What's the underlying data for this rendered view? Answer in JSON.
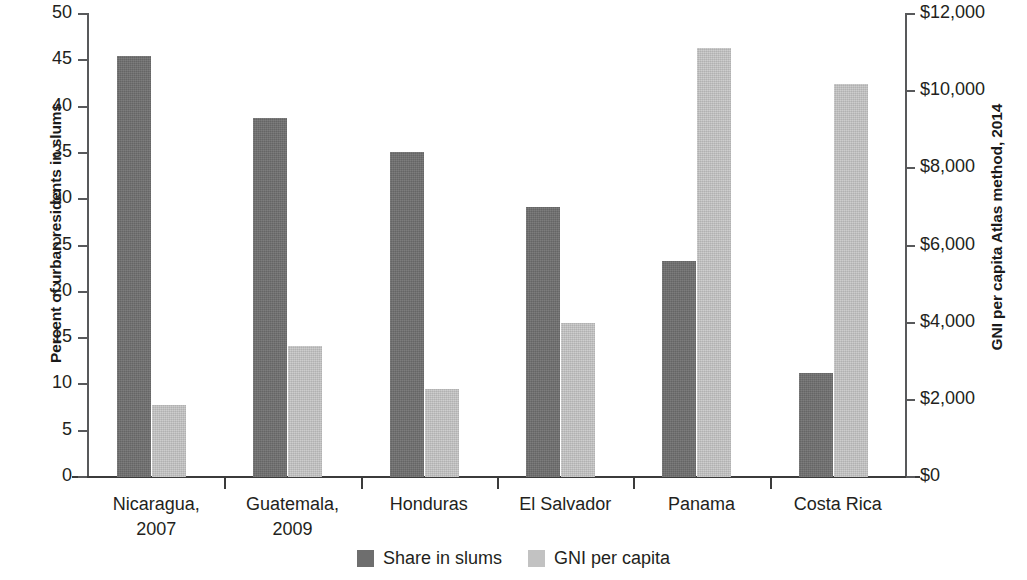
{
  "chart_data": {
    "type": "bar",
    "title": "",
    "categories": [
      "Nicaragua, 2007",
      "Guatemala, 2009",
      "Honduras",
      "El Salvador",
      "Panama",
      "Costa Rica"
    ],
    "category_lines": [
      [
        "Nicaragua,",
        "2007"
      ],
      [
        "Guatemala,",
        "2009"
      ],
      [
        "Honduras"
      ],
      [
        "El Salvador"
      ],
      [
        "Panama"
      ],
      [
        "Costa Rica"
      ]
    ],
    "series": [
      {
        "name": "Share in slums",
        "axis": "left",
        "unit": "percent",
        "color": "#6e6e6e",
        "values": [
          45.5,
          38.8,
          35.1,
          29.2,
          23.3,
          11.2
        ]
      },
      {
        "name": "GNI per capita",
        "axis": "right",
        "unit": "USD",
        "color": "#c2c2c2",
        "values": [
          1870,
          3400,
          2270,
          3980,
          11130,
          10190
        ]
      }
    ],
    "xlabel": "",
    "ylabel": "Percent of urban residents in slums",
    "y2label": "GNI per capita Atlas method, 2014",
    "ylim": [
      0,
      50
    ],
    "y2lim": [
      0,
      12000
    ],
    "yticks": [
      0,
      5,
      10,
      15,
      20,
      25,
      30,
      35,
      40,
      45,
      50
    ],
    "ytick_labels": [
      "0",
      "5",
      "10",
      "15",
      "20",
      "25",
      "30",
      "35",
      "40",
      "45",
      "50"
    ],
    "y2ticks": [
      0,
      2000,
      4000,
      6000,
      8000,
      10000,
      12000
    ],
    "y2tick_labels": [
      "$0",
      "$2,000",
      "$4,000",
      "$6,000",
      "$8,000",
      "$10,000",
      "$12,000"
    ],
    "grid": false,
    "legend_position": "bottom",
    "legend_entries": [
      "Share in slums",
      "GNI per capita"
    ]
  }
}
